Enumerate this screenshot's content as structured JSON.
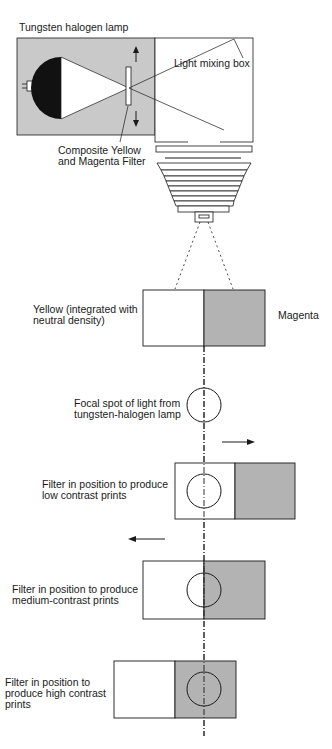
{
  "figure": {
    "title_label": "Tungsten halogen lamp",
    "colors": {
      "housing_gray": "#c9c9c9",
      "magenta_gray": "#b3b3b3",
      "line": "#1a1a1a",
      "white": "#ffffff"
    },
    "enlarger": {
      "mixing_box_label": "Light mixing box",
      "filter_label_line1": "Composite Yellow",
      "filter_label_line2": "and Magenta Filter"
    },
    "filter_strip": {
      "yellow_label_line1": "Yellow (integrated with",
      "yellow_label_line2": "neutral density)",
      "magenta_label": "Magenta"
    },
    "focal_spot": {
      "label_line1": "Focal spot of light from",
      "label_line2": "tungsten-halogen lamp"
    },
    "positions": [
      {
        "id": "low",
        "label_line1": "Filter in position to produce",
        "label_line2": "low contrast prints",
        "label_line3": "",
        "arrow": "right"
      },
      {
        "id": "medium",
        "label_line1": "Filter in position to produce",
        "label_line2": "medium-contrast prints",
        "label_line3": "",
        "arrow": "left"
      },
      {
        "id": "high",
        "label_line1": "Filter in position to",
        "label_line2": "produce high contrast",
        "label_line3": "prints",
        "arrow": "none"
      }
    ]
  }
}
